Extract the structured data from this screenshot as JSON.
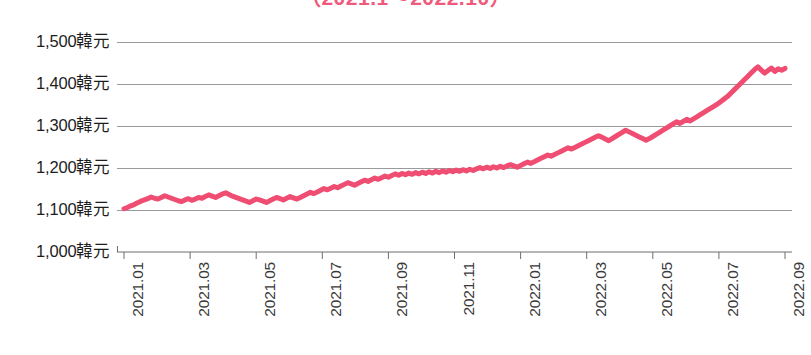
{
  "chart": {
    "title": "（2021.1～2022.10）",
    "currency_suffix": "韓元",
    "line_color": "#ef4d72",
    "grid_color": "#9a9a9a",
    "axis_color": "#6e6e6e",
    "background": "#ffffff"
  },
  "chart_data": {
    "type": "line",
    "title": "（2021.1～2022.10）",
    "xlabel": "",
    "ylabel": "",
    "ylim": [
      1000,
      1500
    ],
    "ytick_values": [
      1500,
      1400,
      1300,
      1200,
      1100,
      1000
    ],
    "ytick_labels": [
      "1,500韓元",
      "1,400韓元",
      "1,300韓元",
      "1,200韓元",
      "1,100韓元",
      "1,000韓元"
    ],
    "xtick_labels": [
      "2021.01",
      "2021.03",
      "2021.05",
      "2021.07",
      "2021.09",
      "2021.11",
      "2022.01",
      "2022.03",
      "2022.05",
      "2022.07",
      "2022.09"
    ],
    "grid": true,
    "grid_axis": "y",
    "legend": false,
    "series": [
      {
        "name": "韓元匯率",
        "color": "#ef4d72",
        "x": [
          "2021.01",
          "2021.02",
          "2021.03",
          "2021.04",
          "2021.05",
          "2021.06",
          "2021.07",
          "2021.08",
          "2021.09",
          "2021.10",
          "2021.11",
          "2021.12",
          "2022.01",
          "2022.02",
          "2022.03",
          "2022.04",
          "2022.05",
          "2022.06",
          "2022.07",
          "2022.08",
          "2022.09",
          "2022.10"
        ],
        "values": [
          1103,
          1120,
          1131,
          1125,
          1122,
          1135,
          1150,
          1166,
          1175,
          1186,
          1190,
          1195,
          1200,
          1205,
          1222,
          1255,
          1275,
          1290,
          1310,
          1330,
          1400,
          1435
        ],
        "values_detail": [
          1103,
          1106,
          1110,
          1113,
          1117,
          1121,
          1124,
          1127,
          1131,
          1128,
          1126,
          1130,
          1134,
          1131,
          1128,
          1125,
          1122,
          1120,
          1124,
          1127,
          1123,
          1126,
          1130,
          1128,
          1132,
          1136,
          1133,
          1130,
          1134,
          1138,
          1141,
          1137,
          1133,
          1130,
          1127,
          1124,
          1121,
          1118,
          1122,
          1126,
          1124,
          1121,
          1118,
          1122,
          1126,
          1130,
          1127,
          1124,
          1128,
          1132,
          1129,
          1126,
          1130,
          1134,
          1138,
          1142,
          1139,
          1143,
          1147,
          1151,
          1148,
          1152,
          1156,
          1153,
          1157,
          1161,
          1165,
          1162,
          1159,
          1163,
          1167,
          1171,
          1168,
          1172,
          1176,
          1173,
          1177,
          1181,
          1178,
          1182,
          1186,
          1183,
          1187,
          1184,
          1188,
          1185,
          1189,
          1186,
          1190,
          1187,
          1191,
          1188,
          1192,
          1189,
          1193,
          1190,
          1194,
          1191,
          1195,
          1192,
          1196,
          1193,
          1197,
          1194,
          1198,
          1201,
          1198,
          1202,
          1199,
          1203,
          1200,
          1204,
          1201,
          1205,
          1208,
          1205,
          1202,
          1206,
          1210,
          1214,
          1211,
          1215,
          1219,
          1223,
          1227,
          1231,
          1228,
          1232,
          1236,
          1240,
          1244,
          1248,
          1245,
          1249,
          1253,
          1257,
          1261,
          1265,
          1269,
          1273,
          1277,
          1273,
          1269,
          1265,
          1270,
          1275,
          1280,
          1285,
          1290,
          1286,
          1282,
          1278,
          1274,
          1270,
          1266,
          1270,
          1275,
          1280,
          1285,
          1290,
          1295,
          1300,
          1305,
          1310,
          1306,
          1311,
          1316,
          1312,
          1317,
          1322,
          1327,
          1332,
          1337,
          1342,
          1347,
          1352,
          1358,
          1364,
          1370,
          1378,
          1386,
          1394,
          1402,
          1410,
          1418,
          1426,
          1434,
          1441,
          1433,
          1426,
          1432,
          1438,
          1430,
          1436,
          1433,
          1437
        ],
        "start_value": 1103,
        "end_value": 1435,
        "min_value": 1103,
        "max_value": 1441
      }
    ]
  }
}
